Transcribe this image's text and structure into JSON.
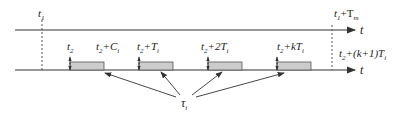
{
  "diagram": {
    "top_axis": {
      "label": "t",
      "marker_start": "t",
      "marker_start_sub": "1",
      "marker_end": "t",
      "marker_end_sub": "1",
      "marker_end_suffix": "+T",
      "marker_end_suffix_sub": "m"
    },
    "bottom_axis": {
      "label": "t"
    },
    "ticks": [
      {
        "base": "t",
        "base_sub": "2",
        "rest": ""
      },
      {
        "base": "t",
        "base_sub": "2",
        "rest": "+C",
        "rest_sub": "i"
      },
      {
        "base": "t",
        "base_sub": "2",
        "rest": "+T",
        "rest_sub": "i"
      },
      {
        "base": "t",
        "base_sub": "2",
        "rest": "+2T",
        "rest_sub": "i"
      },
      {
        "base": "t",
        "base_sub": "2",
        "rest": "+kT",
        "rest_sub": "i"
      },
      {
        "base": "t",
        "base_sub": "2",
        "rest": "+(k+1)T",
        "rest_sub": "i"
      }
    ],
    "task_label": {
      "symbol": "τ",
      "sub": "i"
    },
    "colors": {
      "axis": "#333333",
      "box_fill": "#cccccc",
      "box_stroke": "#555555",
      "dashed": "#555555"
    }
  }
}
